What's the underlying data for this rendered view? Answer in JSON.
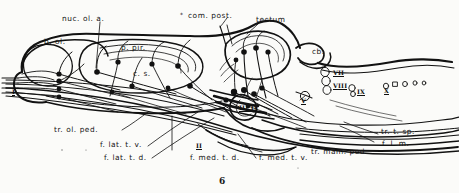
{
  "figure": {
    "number": "6",
    "domain": "neuroanatomy-schematic",
    "ink_color": "#121212",
    "paper_color": "#fbfbf9"
  },
  "labels": {
    "nuc_ol_a": "nuc. ol. a.",
    "b_ol": "b. ol.",
    "p_pir": "p. pir.",
    "c_s": "c. s.",
    "com_post": "com. post.",
    "com_post_marker": "*",
    "tectum": "tectum",
    "cb": "cb.",
    "tr_ol_ped": "tr. ol. ped.",
    "f_lat_t_v": "f. lat. t. v.",
    "f_lat_t_d": "f. lat. t. d.",
    "f_med_t_d": "f. med. t. d.",
    "f_med_t_v": "f. med. t. v.",
    "tr_mam_ped": "tr. mam. ped.",
    "tr_t_sp": "tr. t. sp.",
    "f_l_m": "f. l. m."
  },
  "cranial_nerves": {
    "one": "I",
    "two": "II",
    "three_four": "III IV",
    "five": "V",
    "seven": "VII",
    "eight": "VIII",
    "nine": "IX",
    "ten": "X"
  }
}
